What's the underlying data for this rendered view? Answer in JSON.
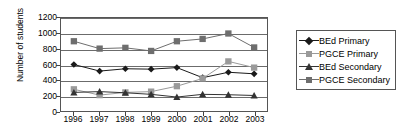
{
  "chart_data": {
    "type": "line",
    "title": "",
    "xlabel": "",
    "ylabel": "Number of students",
    "categories": [
      "1996",
      "1997",
      "1998",
      "1999",
      "2000",
      "2001",
      "2002",
      "2003"
    ],
    "ylim": [
      0,
      1200
    ],
    "ytick_step": 200,
    "yticks": [
      "1200",
      "1000",
      "800",
      "600",
      "400",
      "200",
      "0"
    ],
    "grid": true,
    "legend_position": "right",
    "series": [
      {
        "name": "BEd Primary",
        "marker": "diamond",
        "color": "#1a1a1a",
        "values": [
          600,
          515,
          545,
          540,
          560,
          430,
          500,
          480
        ]
      },
      {
        "name": "PGCE Primary",
        "marker": "square",
        "color": "#9a9a9a",
        "values": [
          280,
          205,
          240,
          250,
          320,
          420,
          640,
          560
        ]
      },
      {
        "name": "BEd Secondary",
        "marker": "triangle",
        "color": "#333333",
        "values": [
          240,
          250,
          235,
          215,
          180,
          215,
          210,
          200
        ]
      },
      {
        "name": "PGCE Secondary",
        "marker": "square",
        "color": "#6e6e6e",
        "values": [
          900,
          805,
          815,
          775,
          900,
          930,
          1000,
          820
        ]
      }
    ]
  }
}
